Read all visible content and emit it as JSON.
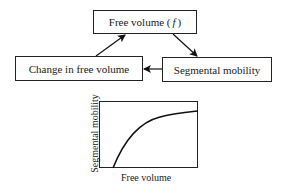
{
  "diagram": {
    "nodes": [
      {
        "id": "free_volume",
        "label": "Free volume (",
        "symbol": "f",
        "close": ")"
      },
      {
        "id": "change_in_free_volume",
        "label": "Change in free volume"
      },
      {
        "id": "segmental_mobility",
        "label": "Segmental mobility"
      }
    ],
    "edges": [
      {
        "from": "free_volume",
        "to": "segmental_mobility"
      },
      {
        "from": "segmental_mobility",
        "to": "change_in_free_volume"
      },
      {
        "from": "change_in_free_volume",
        "to": "free_volume"
      }
    ]
  },
  "plot": {
    "xlabel": "Free volume",
    "ylabel": "Segmental mobility",
    "curve": "concave increasing, saturating"
  }
}
